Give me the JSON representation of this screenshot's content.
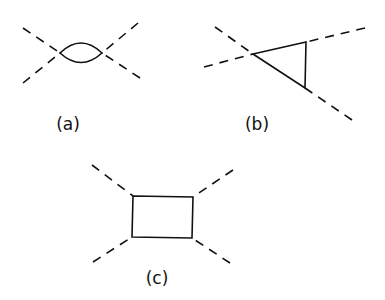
{
  "diagrams": [
    {
      "id": "a",
      "label": "(a)",
      "description": "bubble diagram: two vertices joined by two solid propagators, four dashed external legs",
      "label_pos": [
        68,
        124
      ],
      "vertices": [
        [
          60,
          53
        ],
        [
          102,
          53
        ]
      ],
      "external_legs": [
        [
          [
            23,
            28
          ],
          [
            60,
            53
          ]
        ],
        [
          [
            23,
            83
          ],
          [
            60,
            53
          ]
        ],
        [
          [
            138,
            23
          ],
          [
            102,
            53
          ]
        ],
        [
          [
            140,
            78
          ],
          [
            102,
            53
          ]
        ]
      ]
    },
    {
      "id": "b",
      "label": "(b)",
      "description": "triangle diagram: three vertices joined by solid lines, dashed external legs",
      "label_pos": [
        257,
        124
      ],
      "vertices": [
        [
          253,
          54
        ],
        [
          306,
          42
        ],
        [
          305,
          88
        ]
      ],
      "external_legs": [
        [
          [
            215,
            27
          ],
          [
            253,
            54
          ]
        ],
        [
          [
            204,
            67
          ],
          [
            253,
            54
          ]
        ],
        [
          [
            365,
            28
          ],
          [
            306,
            42
          ]
        ],
        [
          [
            352,
            120
          ],
          [
            305,
            88
          ]
        ]
      ]
    },
    {
      "id": "c",
      "label": "(c)",
      "description": "box diagram: four vertices forming rectangle of solid lines, four dashed external legs",
      "label_pos": [
        157,
        278
      ],
      "vertices": [
        [
          133,
          196
        ],
        [
          193,
          197
        ],
        [
          192,
          238
        ],
        [
          132,
          237
        ]
      ],
      "external_legs": [
        [
          [
            92,
            165
          ],
          [
            133,
            196
          ]
        ],
        [
          [
            233,
            170
          ],
          [
            193,
            197
          ]
        ],
        [
          [
            230,
            263
          ],
          [
            192,
            238
          ]
        ],
        [
          [
            93,
            262
          ],
          [
            132,
            237
          ]
        ]
      ]
    }
  ],
  "colors": {
    "line": "#111111",
    "background": "#ffffff"
  }
}
